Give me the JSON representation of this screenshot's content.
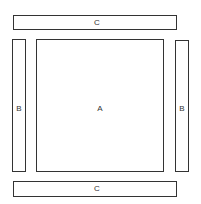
{
  "diagram": {
    "regions": {
      "A": {
        "label": "A",
        "x": 36,
        "y": 39,
        "w": 128,
        "h": 133
      },
      "B_left": {
        "label": "B",
        "x": 12,
        "y": 39,
        "w": 14,
        "h": 133
      },
      "B_right": {
        "label": "B",
        "x": 175,
        "y": 40,
        "w": 14,
        "h": 132
      },
      "C_top": {
        "label": "C",
        "x": 13,
        "y": 15,
        "w": 164,
        "h": 15
      },
      "C_bottom": {
        "label": "C",
        "x": 13,
        "y": 181,
        "w": 164,
        "h": 16
      }
    },
    "stroke_color": "#333333",
    "fill_color": "#ffffff"
  }
}
